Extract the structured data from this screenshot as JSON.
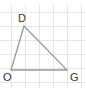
{
  "diagram": {
    "type": "triangle-on-grid",
    "grid": {
      "color": "#e6e6e6",
      "x_lines": [
        11,
        25,
        39,
        53,
        67,
        81
      ],
      "y_lines": [
        12,
        26,
        40,
        54,
        68,
        82
      ]
    },
    "triangle": {
      "stroke": "#9a9a9a",
      "vertices": [
        {
          "name": "D",
          "x": 24,
          "y": 26,
          "label_x": 18,
          "label_y": 22
        },
        {
          "name": "O",
          "x": 11,
          "y": 70,
          "label_x": 3,
          "label_y": 81
        },
        {
          "name": "G",
          "x": 67,
          "y": 70,
          "label_x": 70,
          "label_y": 81
        }
      ]
    },
    "labels": {
      "D": "D",
      "O": "O",
      "G": "G"
    }
  }
}
